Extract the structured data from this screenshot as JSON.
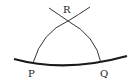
{
  "diagram": {
    "type": "geometric-construction",
    "labels": {
      "P": "P",
      "Q": "Q",
      "R": "R"
    },
    "colors": {
      "stroke": "#1a1a1a",
      "background": "#ffffff"
    }
  }
}
